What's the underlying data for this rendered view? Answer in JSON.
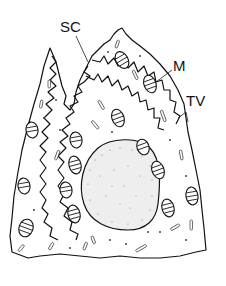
{
  "figure": {
    "labels": [
      {
        "id": "sc",
        "text": "SC",
        "x": 60,
        "y": 32
      },
      {
        "id": "m",
        "text": "M",
        "x": 173,
        "y": 71
      },
      {
        "id": "tv",
        "text": "TV",
        "x": 186,
        "y": 106
      }
    ],
    "colors": {
      "stroke": "#111111",
      "background": "#ffffff"
    }
  }
}
